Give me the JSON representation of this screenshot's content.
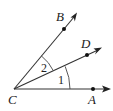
{
  "diagram": {
    "vertex": {
      "label": "C",
      "x": 14,
      "y": 89
    },
    "rays": [
      {
        "name": "CA",
        "point_label": "A",
        "point": [
          93,
          89
        ],
        "tip": [
          110,
          89
        ],
        "label_pos": [
          88,
          104
        ]
      },
      {
        "name": "CD",
        "point_label": "D",
        "point": [
          87,
          55
        ],
        "tip": [
          101,
          48
        ],
        "label_pos": [
          81,
          48
        ]
      },
      {
        "name": "CB",
        "point_label": "B",
        "point": [
          64,
          28
        ],
        "tip": [
          76,
          14
        ],
        "label_pos": [
          56,
          21
        ]
      }
    ],
    "angles": [
      {
        "label": "1",
        "between": [
          "CA",
          "CD"
        ],
        "label_pos": [
          58,
          84
        ]
      },
      {
        "label": "2",
        "between": [
          "CD",
          "CB"
        ],
        "label_pos": [
          41,
          72
        ]
      }
    ],
    "labels": {
      "A": "A",
      "B": "B",
      "C": "C",
      "D": "D",
      "angle1": "1",
      "angle2": "2"
    },
    "colors": {
      "line": "#333333",
      "text": "#222222",
      "background": "#ffffff"
    }
  }
}
